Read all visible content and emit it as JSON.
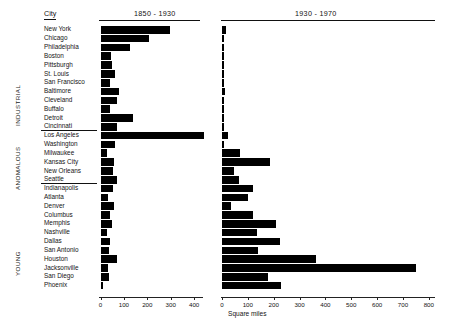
{
  "figure": {
    "city_column_header": "City",
    "x_axis_title": "Square miles",
    "panels": [
      {
        "key": "p1850_1930",
        "label": "1850 - 1930",
        "x_max": 440,
        "ticks": [
          0,
          100,
          200,
          300,
          400
        ]
      },
      {
        "key": "p1930_1970",
        "label": "1930 - 1970",
        "x_max": 820,
        "ticks": [
          0,
          100,
          200,
          300,
          400,
          500,
          600,
          700,
          800
        ]
      }
    ],
    "groups": [
      {
        "key": "industrial",
        "label": "INDUSTRIAL"
      },
      {
        "key": "anomalous",
        "label": "ANOMALOUS"
      },
      {
        "key": "young",
        "label": "YOUNG"
      }
    ]
  },
  "chart_data": {
    "type": "bar",
    "xlabel": "Square miles",
    "ylabel": "City",
    "orientation": "horizontal",
    "grid": false,
    "legend": "none",
    "panel_labels": [
      "1850 - 1930",
      "1930 - 1970"
    ],
    "xlim_panel_1": [
      0,
      440
    ],
    "xlim_panel_2": [
      0,
      820
    ],
    "xticks_panel_1": [
      0,
      100,
      200,
      300,
      400
    ],
    "xticks_panel_2": [
      0,
      100,
      200,
      300,
      400,
      500,
      600,
      700,
      800
    ],
    "categories": [
      "New York",
      "Chicago",
      "Philadelphia",
      "Boston",
      "Pittsburgh",
      "St. Louis",
      "San Francisco",
      "Baltimore",
      "Cleveland",
      "Buffalo",
      "Detroit",
      "Cincinnati",
      "Los Angeles",
      "Washington",
      "Milwaukee",
      "Kansas City",
      "New Orleans",
      "Seattle",
      "Indianapolis",
      "Atlanta",
      "Denver",
      "Columbus",
      "Memphis",
      "Nashville",
      "Dallas",
      "San Antonio",
      "Houston",
      "Jacksonville",
      "San Diego",
      "Phoenix"
    ],
    "group_of_category": [
      "INDUSTRIAL",
      "INDUSTRIAL",
      "INDUSTRIAL",
      "INDUSTRIAL",
      "INDUSTRIAL",
      "INDUSTRIAL",
      "INDUSTRIAL",
      "INDUSTRIAL",
      "INDUSTRIAL",
      "INDUSTRIAL",
      "INDUSTRIAL",
      "INDUSTRIAL",
      "ANOMALOUS",
      "ANOMALOUS",
      "ANOMALOUS",
      "ANOMALOUS",
      "ANOMALOUS",
      "ANOMALOUS",
      "YOUNG",
      "YOUNG",
      "YOUNG",
      "YOUNG",
      "YOUNG",
      "YOUNG",
      "YOUNG",
      "YOUNG",
      "YOUNG",
      "YOUNG",
      "YOUNG",
      "YOUNG"
    ],
    "series": [
      {
        "name": "1850 - 1930",
        "values": [
          299,
          207,
          128,
          44,
          51,
          61,
          42,
          79,
          71,
          39,
          139,
          72,
          442,
          62,
          27,
          59,
          52,
          70,
          54,
          34,
          59,
          39,
          47,
          28,
          42,
          36,
          72,
          31,
          35,
          9
        ]
      },
      {
        "name": "1930 - 1970",
        "values": [
          16,
          3,
          7,
          2,
          4,
          1,
          3,
          11,
          5,
          3,
          1,
          5,
          22,
          2,
          68,
          186,
          47,
          64,
          118,
          102,
          36,
          118,
          207,
          136,
          223,
          140,
          362,
          751,
          177,
          229
        ]
      }
    ]
  }
}
